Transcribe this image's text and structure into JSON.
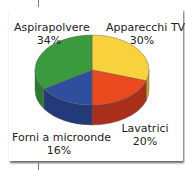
{
  "chart_data": {
    "type": "pie",
    "style": "3d",
    "title": "",
    "categories": [
      "Apparecchi TV",
      "Lavatrici",
      "Forni a microonde",
      "Aspirapolvere"
    ],
    "values": [
      30,
      20,
      16,
      34
    ],
    "labels": [
      {
        "name": "Apparecchi TV",
        "pct": "30%"
      },
      {
        "name": "Lavatrici",
        "pct": "20%"
      },
      {
        "name": "Forni a microonde",
        "pct": "16%"
      },
      {
        "name": "Aspirapolvere",
        "pct": "34%"
      }
    ],
    "colors": [
      "#f7d23c",
      "#ea4a1e",
      "#2f4f9e",
      "#3a9a3e"
    ],
    "side_colors": [
      "#c9a320",
      "#a8301a",
      "#22397a",
      "#2b7a30"
    ],
    "legend": "none"
  }
}
